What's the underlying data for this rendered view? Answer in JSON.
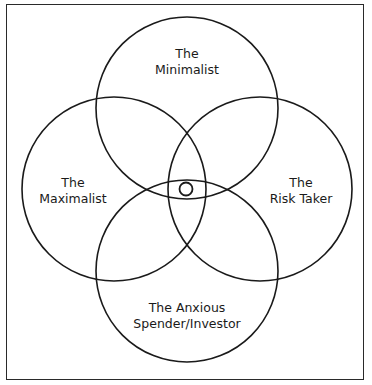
{
  "diagram": {
    "type": "venn",
    "line_color": "#1a1a1a",
    "background": "#ffffff",
    "sets": [
      {
        "id": "minimalist",
        "label_line1": "The",
        "label_line2": "Minimalist"
      },
      {
        "id": "maximalist",
        "label_line1": "The",
        "label_line2": "Maximalist"
      },
      {
        "id": "risk_taker",
        "label_line1": "The",
        "label_line2": "Risk Taker"
      },
      {
        "id": "anxious",
        "label_line1": "The Anxious",
        "label_line2": "Spender/Investor"
      }
    ],
    "center_marker": "small-circle"
  }
}
